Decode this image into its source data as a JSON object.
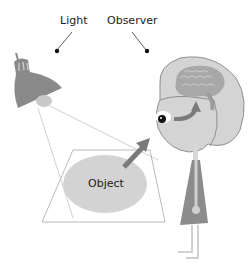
{
  "labels": {
    "light": "Light",
    "observer": "Observer",
    "object": "Object"
  },
  "colors": {
    "lamp": "#8a8a8a",
    "lamp_bulb": "#c8c8c8",
    "head": "#d4d4d4",
    "head_outline": "#8f8f8f",
    "brain": "#a8a8a8",
    "arrow": "#7a7a7a",
    "object_ellipse": "#d3d3d3",
    "body_dress": "#8c8c8c",
    "neck_legs": "#d8d8d8",
    "lines": "#bdbdbd",
    "text": "#222222"
  }
}
